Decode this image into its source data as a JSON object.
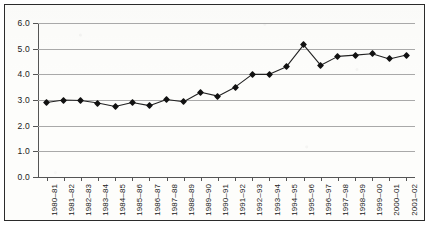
{
  "chart_data": {
    "type": "line",
    "title": "",
    "subtitle": "",
    "xlabel": "",
    "ylabel": "",
    "grid": true,
    "legend": "none",
    "marker": "filled-diamond",
    "ylim": [
      0.0,
      6.0
    ],
    "ytick_step": 1.0,
    "ytick_labels": [
      "0.0",
      "1.0",
      "2.0",
      "3.0",
      "4.0",
      "5.0",
      "6.0"
    ],
    "ytick_values": [
      0.0,
      1.0,
      2.0,
      3.0,
      4.0,
      5.0,
      6.0
    ],
    "categories": [
      "1980–81",
      "1981–82",
      "1982–83",
      "1983–84",
      "1984–85",
      "1985–86",
      "1986–87",
      "1987–88",
      "1988–89",
      "1989–90",
      "1990–91",
      "1991–92",
      "1992–93",
      "1993–94",
      "1994–95",
      "1995–96",
      "1996–97",
      "1997–98",
      "1998–99",
      "1999–00",
      "2000–01",
      "2001–02"
    ],
    "values": [
      2.9,
      3.0,
      2.98,
      2.88,
      2.75,
      2.9,
      2.78,
      3.02,
      2.93,
      3.3,
      3.15,
      3.5,
      4.0,
      4.0,
      4.3,
      5.15,
      4.35,
      4.7,
      4.75,
      4.8,
      4.6,
      4.75
    ],
    "series": [
      {
        "name": "series-1",
        "values": [
          2.9,
          3.0,
          2.98,
          2.88,
          2.75,
          2.9,
          2.78,
          3.02,
          2.93,
          3.3,
          3.15,
          3.5,
          4.0,
          4.0,
          4.3,
          5.15,
          4.35,
          4.7,
          4.75,
          4.8,
          4.6,
          4.75
        ]
      }
    ],
    "colors": {
      "line": "#222222",
      "marker": "#111111",
      "grid": "#a9a9a9",
      "axis": "#555555",
      "frame": "#2b2b2b",
      "background": "#fdfdfb"
    }
  }
}
